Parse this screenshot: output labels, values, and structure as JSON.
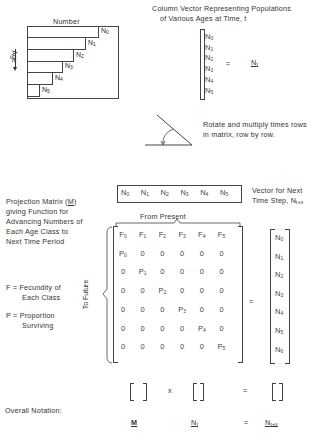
{
  "age_diagram": {
    "title": "Number",
    "axis_label": "Age",
    "bars": [
      {
        "label": "N",
        "sub": "0"
      },
      {
        "label": "N",
        "sub": "1"
      },
      {
        "label": "N",
        "sub": "2"
      },
      {
        "label": "N",
        "sub": "3"
      },
      {
        "label": "N",
        "sub": "4"
      },
      {
        "label": "N",
        "sub": "5"
      }
    ]
  },
  "column_vector": {
    "caption_line1": "Column Vector Representing Populations",
    "caption_line2": "of Various Ages at Time, t",
    "items": [
      "N0",
      "N1",
      "N2",
      "N3",
      "N4",
      "N5"
    ],
    "equals": "=",
    "symbol": "N",
    "symbol_sub": "t"
  },
  "rotate": {
    "line1": "Rotate and multiply times rows",
    "line2": "in matrix, row by row."
  },
  "projection": {
    "desc_lines": [
      "Projection Matrix (M)",
      "giving Function for",
      "Advancing Numbers of",
      "Each Age Class to",
      "Next Time Period"
    ],
    "row_vector": [
      "N0",
      "N1",
      "N2",
      "N3",
      "N4",
      "N5"
    ],
    "from_label": "From Present",
    "to_label": "To Future",
    "matrix": [
      [
        "F0",
        "F1",
        "F2",
        "F3",
        "F4",
        "F5"
      ],
      [
        "P0",
        "0",
        "0",
        "0",
        "0",
        "0"
      ],
      [
        "0",
        "P1",
        "0",
        "0",
        "0",
        "0"
      ],
      [
        "0",
        "0",
        "P2",
        "0",
        "0",
        "0"
      ],
      [
        "0",
        "0",
        "0",
        "P3",
        "0",
        "0"
      ],
      [
        "0",
        "0",
        "0",
        "0",
        "P4",
        "0"
      ],
      [
        "0",
        "0",
        "0",
        "0",
        "0",
        "P5"
      ]
    ],
    "equals": "="
  },
  "legend": {
    "f_line1": "F = Fecundity of",
    "f_line2": "Each Class",
    "p_line1": "P = Proportion",
    "p_line2": "Surviving"
  },
  "next_vector": {
    "caption_line1": "Vector for Next",
    "caption_line2": "Time Step, N",
    "caption_sub": "t+x",
    "items": [
      "N0",
      "N1",
      "N2",
      "N3",
      "N4",
      "N5",
      "N6"
    ]
  },
  "overall": {
    "label": "Overall Notation:",
    "times": "x",
    "equals": "=",
    "m": "M",
    "nt": "N",
    "nt_sub": "t",
    "ntx": "N",
    "ntx_sub": "t+x"
  }
}
